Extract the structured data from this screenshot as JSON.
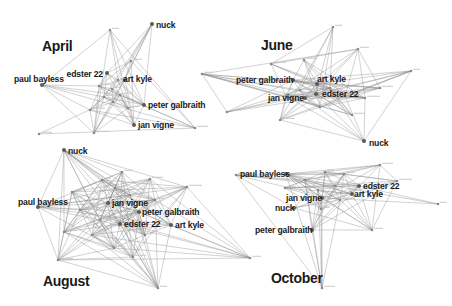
{
  "figure": {
    "type": "network-snapshots",
    "colors": {
      "edge": "#8a8a8a",
      "node": "#5a5a5a",
      "label": "#1a1a1a",
      "background": "#ffffff"
    }
  },
  "panels": [
    {
      "id": "april",
      "title": "April",
      "labeled_nodes": [
        {
          "id": "nuck",
          "label": "nuck"
        },
        {
          "id": "edster22",
          "label": "edster 22"
        },
        {
          "id": "artkyle",
          "label": "art kyle"
        },
        {
          "id": "paulbayless",
          "label": "paul bayless"
        },
        {
          "id": "petergalbraith",
          "label": "peter galbraith"
        },
        {
          "id": "janvigne",
          "label": "jan vigne"
        }
      ]
    },
    {
      "id": "june",
      "title": "June",
      "labeled_nodes": [
        {
          "id": "petergalbraith",
          "label": "peter galbraith"
        },
        {
          "id": "artkyle",
          "label": "art kyle"
        },
        {
          "id": "janvigne",
          "label": "jan vigne"
        },
        {
          "id": "edster22",
          "label": "edster 22"
        },
        {
          "id": "nuck",
          "label": "nuck"
        }
      ]
    },
    {
      "id": "august",
      "title": "August",
      "labeled_nodes": [
        {
          "id": "nuck",
          "label": "nuck"
        },
        {
          "id": "paulbayless",
          "label": "paul bayless"
        },
        {
          "id": "janvigne",
          "label": "jan vigne"
        },
        {
          "id": "petergalbraith",
          "label": "peter galbraith"
        },
        {
          "id": "edster22",
          "label": "edster 22"
        },
        {
          "id": "artkyle",
          "label": "art kyle"
        }
      ]
    },
    {
      "id": "october",
      "title": "October",
      "labeled_nodes": [
        {
          "id": "paulbayless",
          "label": "paul bayless"
        },
        {
          "id": "edster22",
          "label": "edster 22"
        },
        {
          "id": "janvigne",
          "label": "jan vigne"
        },
        {
          "id": "artkyle",
          "label": "art kyle"
        },
        {
          "id": "nuck",
          "label": "nuck"
        },
        {
          "id": "petergalbraith",
          "label": "peter galbraith"
        }
      ]
    }
  ]
}
